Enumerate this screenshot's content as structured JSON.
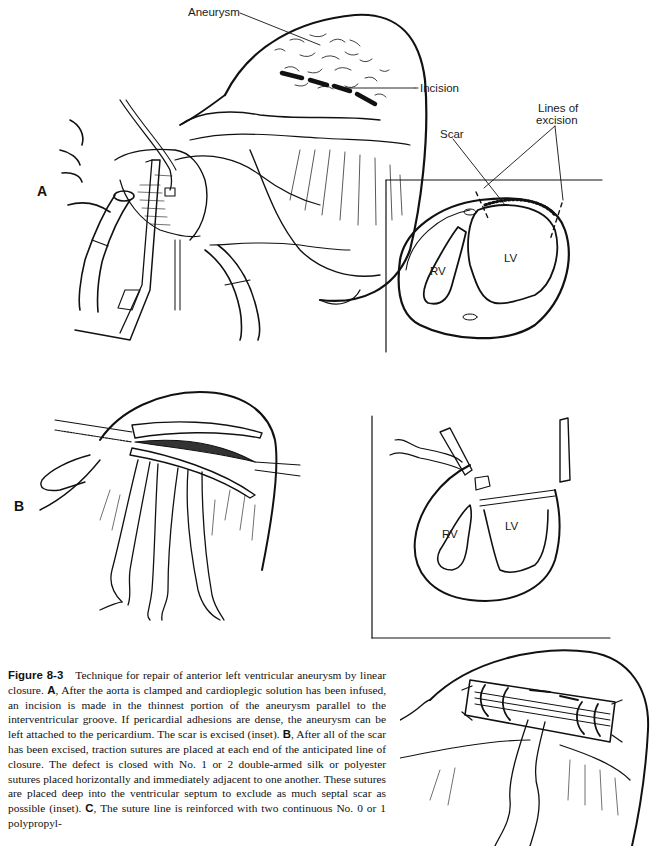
{
  "figure": {
    "number_label": "Figure 8-3",
    "caption_segments": [
      {
        "type": "text",
        "text": "Technique for repair of anterior left ventricular aneurysm by linear closure. "
      },
      {
        "type": "bold",
        "text": "A"
      },
      {
        "type": "text",
        "text": ", After the aorta is clamped and cardioplegic solution has been infused, an incision is made in the thinnest portion of the aneurysm parallel to the interventricular groove. If pericardial adhesions are dense, the aneurysm can be left attached to the pericardium. The scar is excised (inset). "
      },
      {
        "type": "bold",
        "text": "B"
      },
      {
        "type": "text",
        "text": ", After all of the scar has been excised, traction sutures are placed at each end of the anticipated line of closure. The defect is closed with No. 1 or 2 double-armed silk or polyester sutures placed horizontally and immediately adjacent to one another. These sutures are placed deep into the ventricular septum to exclude as much septal scar as possible (inset). "
      },
      {
        "type": "bold",
        "text": "C"
      },
      {
        "type": "text",
        "text": ", The suture line is reinforced with two continuous No. 0 or 1 polypropyl-"
      }
    ]
  },
  "panels": {
    "a": {
      "letter": "A",
      "labels": {
        "aneurysm": "Aneurysm",
        "incision": "Incision",
        "scar": "Scar",
        "lines_of_excision_1": "Lines of",
        "lines_of_excision_2": "excision"
      },
      "inset": {
        "rv": "RV",
        "lv": "LV"
      }
    },
    "b": {
      "letter": "B",
      "inset": {
        "rv": "RV",
        "lv": "LV"
      }
    },
    "c": {}
  },
  "colors": {
    "ink": "#111111",
    "paper": "#ffffff",
    "label": "#1a1a1a"
  }
}
